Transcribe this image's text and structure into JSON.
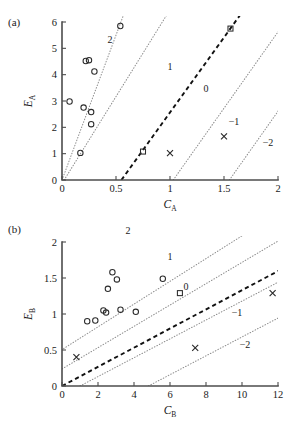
{
  "figure": {
    "panel_a_label": "(a)",
    "panel_b_label": "(b)"
  },
  "chart_data": [
    {
      "type": "scatter",
      "panel": "(a)",
      "title": "",
      "xlabel": "C",
      "xlabel_sub": "A",
      "ylabel": "E",
      "ylabel_sub": "A",
      "xlim": [
        0,
        2
      ],
      "ylim": [
        0,
        6
      ],
      "xticks": [
        0,
        0.5,
        1,
        1.5,
        2
      ],
      "xticklabels": [
        "0",
        "0.5",
        "1",
        "1.5",
        "2"
      ],
      "yticks": [
        0,
        1,
        2,
        3,
        4,
        5,
        6
      ],
      "yticklabels": [
        "0",
        "1",
        "2",
        "3",
        "4",
        "5",
        "6"
      ],
      "grid": false,
      "legend": "none",
      "series": [
        {
          "name": "circles",
          "marker": "circle",
          "points": [
            [
              0.07,
              2.98
            ],
            [
              0.17,
              1.03
            ],
            [
              0.2,
              2.75
            ],
            [
              0.22,
              4.52
            ],
            [
              0.25,
              4.55
            ],
            [
              0.27,
              2.58
            ],
            [
              0.27,
              2.12
            ],
            [
              0.3,
              4.12
            ],
            [
              0.54,
              5.85
            ]
          ]
        },
        {
          "name": "squares",
          "marker": "square",
          "points": [
            [
              0.75,
              1.08
            ],
            [
              1.56,
              5.75
            ]
          ]
        },
        {
          "name": "crosses",
          "marker": "x",
          "points": [
            [
              1.0,
              1.02
            ],
            [
              1.5,
              1.66
            ]
          ]
        }
      ],
      "lines": [
        {
          "label": "2",
          "x_intercept": 0.0,
          "slope": 11.0,
          "style": "dotted"
        },
        {
          "label": "1",
          "x_intercept": 0.02,
          "slope": 6.6,
          "style": "dotted"
        },
        {
          "label": "0",
          "x_intercept": 0.55,
          "slope": 5.7,
          "style": "dashed-bold"
        },
        {
          "label": "-1",
          "x_intercept": 1.03,
          "slope": 5.8,
          "style": "dotted"
        },
        {
          "label": "-2",
          "x_intercept": 1.55,
          "slope": 5.8,
          "style": "dotted"
        }
      ],
      "line_labels": [
        "2",
        "1",
        "0",
        "−1",
        "−2"
      ]
    },
    {
      "type": "scatter",
      "panel": "(b)",
      "title": "",
      "xlabel": "C",
      "xlabel_sub": "B",
      "ylabel": "E",
      "ylabel_sub": "B",
      "xlim": [
        0,
        12
      ],
      "ylim": [
        0,
        2
      ],
      "xticks": [
        0,
        2,
        4,
        6,
        8,
        10,
        12
      ],
      "xticklabels": [
        "0",
        "2",
        "4",
        "6",
        "8",
        "10",
        "12"
      ],
      "yticks": [
        0,
        0.5,
        1,
        1.5,
        2
      ],
      "yticklabels": [
        "0",
        "0.5",
        "1",
        "1.5",
        "2"
      ],
      "grid": false,
      "legend": "none",
      "series": [
        {
          "name": "circles",
          "marker": "circle",
          "points": [
            [
              1.4,
              0.9
            ],
            [
              1.85,
              0.91
            ],
            [
              2.3,
              1.05
            ],
            [
              2.45,
              1.02
            ],
            [
              2.55,
              1.35
            ],
            [
              2.8,
              1.58
            ],
            [
              3.05,
              1.48
            ],
            [
              3.25,
              1.06
            ],
            [
              4.1,
              1.03
            ],
            [
              5.6,
              1.49
            ]
          ]
        },
        {
          "name": "squares",
          "marker": "square",
          "points": [
            [
              6.55,
              1.29
            ]
          ]
        },
        {
          "name": "crosses",
          "marker": "x",
          "points": [
            [
              0.8,
              0.4
            ],
            [
              7.4,
              0.53
            ],
            [
              11.7,
              1.29
            ]
          ]
        }
      ],
      "lines": [
        {
          "label": "2",
          "x_intercept": -3.2,
          "slope": 0.158,
          "style": "dotted"
        },
        {
          "label": "1",
          "x_intercept": -1.6,
          "slope": 0.148,
          "style": "dotted"
        },
        {
          "label": "0",
          "x_intercept": 0.0,
          "slope": 0.133,
          "style": "dashed-bold"
        },
        {
          "label": "-1",
          "x_intercept": 1.0,
          "slope": 0.131,
          "style": "dotted"
        },
        {
          "label": "-2",
          "x_intercept": 4.8,
          "slope": 0.131,
          "style": "dotted"
        }
      ],
      "line_labels": [
        "2",
        "1",
        "0",
        "−1",
        "−2"
      ]
    }
  ]
}
